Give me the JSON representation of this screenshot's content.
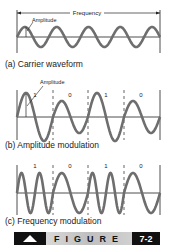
{
  "panel_a": {
    "frequency_label": "Frequency",
    "amplitude_label": "Amplitude",
    "caption": "(a)  Carrier waveform"
  },
  "panel_b": {
    "amplitude_label": "Amplitude",
    "bits": [
      "1",
      "0",
      "1",
      "0"
    ],
    "caption": "(b)  Amplitude modulation"
  },
  "panel_c": {
    "bits": [
      "1",
      "0",
      "1",
      "0"
    ],
    "caption": "(c) Frequency modulation"
  },
  "banner": {
    "word": "FIGURE",
    "number": "7-2"
  },
  "colors": {
    "wave": "#6e6e6e",
    "line": "#222222",
    "banner_dark": "#111111"
  }
}
